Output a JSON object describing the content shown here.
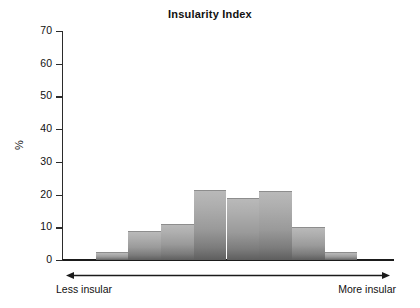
{
  "chart_data": {
    "type": "bar",
    "title": "Insularity Index",
    "xlabel": "",
    "ylabel": "%",
    "ylim": [
      0,
      70
    ],
    "yticks": [
      0,
      10,
      20,
      30,
      40,
      50,
      60,
      70
    ],
    "ytick_labels": [
      "0",
      "10",
      "20",
      "30",
      "40",
      "50",
      "60",
      "70"
    ],
    "grid": false,
    "legend": false,
    "bar_gap": 0,
    "bar_color": "#9a9a9a",
    "categories": [
      "1",
      "2",
      "3",
      "4",
      "5",
      "6",
      "7",
      "8",
      "9",
      "10"
    ],
    "values": [
      0,
      2.5,
      9,
      11,
      21.5,
      19,
      21,
      10,
      2.5,
      0
    ],
    "annotations": {
      "axis_arrow": "double-headed horizontal arrow spanning full x-axis",
      "left_end": "Less insular",
      "right_end": "More insular"
    }
  },
  "axis_ends": {
    "left": "Less insular",
    "right": "More insular"
  },
  "icons": {
    "arrow_left": "arrow-left-icon",
    "arrow_right": "arrow-right-icon"
  }
}
